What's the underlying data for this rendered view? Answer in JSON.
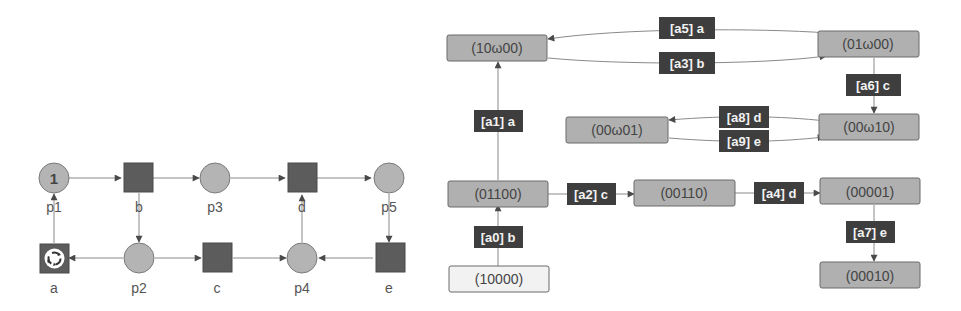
{
  "petri_net": {
    "places": [
      {
        "id": "p1",
        "label": "p1",
        "tokens": "1"
      },
      {
        "id": "p2",
        "label": "p2",
        "tokens": ""
      },
      {
        "id": "p3",
        "label": "p3",
        "tokens": ""
      },
      {
        "id": "p4",
        "label": "p4",
        "tokens": ""
      },
      {
        "id": "p5",
        "label": "p5",
        "tokens": ""
      }
    ],
    "transitions": [
      {
        "id": "a",
        "label": "a",
        "icon": "refresh-cycle-icon"
      },
      {
        "id": "b",
        "label": "b"
      },
      {
        "id": "c",
        "label": "c"
      },
      {
        "id": "d",
        "label": "d"
      },
      {
        "id": "e",
        "label": "e"
      }
    ],
    "arcs": [
      {
        "from": "p1",
        "to": "b"
      },
      {
        "from": "b",
        "to": "p3"
      },
      {
        "from": "p3",
        "to": "d"
      },
      {
        "from": "d",
        "to": "p5"
      },
      {
        "from": "b",
        "to": "p2"
      },
      {
        "from": "p2",
        "to": "a"
      },
      {
        "from": "a",
        "to": "p1"
      },
      {
        "from": "p2",
        "to": "c"
      },
      {
        "from": "c",
        "to": "p4"
      },
      {
        "from": "p4",
        "to": "d"
      },
      {
        "from": "p5",
        "to": "e"
      },
      {
        "from": "e",
        "to": "p4"
      }
    ]
  },
  "coverability_graph": {
    "states": [
      {
        "id": "s10000",
        "label": "(10000)",
        "initial": true
      },
      {
        "id": "s01100",
        "label": "(01100)"
      },
      {
        "id": "s10w00",
        "label": "(10ω00)"
      },
      {
        "id": "s01w00",
        "label": "(01ω00)"
      },
      {
        "id": "s00w10",
        "label": "(00ω10)"
      },
      {
        "id": "s00w01",
        "label": "(00ω01)"
      },
      {
        "id": "s00110",
        "label": "(00110)"
      },
      {
        "id": "s00001",
        "label": "(00001)"
      },
      {
        "id": "s00010",
        "label": "(00010)"
      }
    ],
    "edges": [
      {
        "id": "a0",
        "label": "[a0] b",
        "from": "(10000)",
        "to": "(01100)"
      },
      {
        "id": "a1",
        "label": "[a1] a",
        "from": "(01100)",
        "to": "(10ω00)"
      },
      {
        "id": "a2",
        "label": "[a2] c",
        "from": "(01100)",
        "to": "(00110)"
      },
      {
        "id": "a3",
        "label": "[a3] b",
        "from": "(10ω00)",
        "to": "(01ω00)"
      },
      {
        "id": "a4",
        "label": "[a4] d",
        "from": "(00110)",
        "to": "(00001)"
      },
      {
        "id": "a5",
        "label": "[a5] a",
        "from": "(01ω00)",
        "to": "(10ω00)"
      },
      {
        "id": "a6",
        "label": "[a6] c",
        "from": "(01ω00)",
        "to": "(00ω10)"
      },
      {
        "id": "a7",
        "label": "[a7] e",
        "from": "(00001)",
        "to": "(00010)"
      },
      {
        "id": "a8",
        "label": "[a8] d",
        "from": "(00ω10)",
        "to": "(00ω01)"
      },
      {
        "id": "a9",
        "label": "[a9] e",
        "from": "(00ω01)",
        "to": "(00ω10)"
      }
    ]
  },
  "colors": {
    "place_fill": "#b4b4b4",
    "transition_fill": "#5c5c5c",
    "state_fill": "#b0b0b0",
    "initial_state_fill": "#f2f2f2",
    "edge_label_bg": "#3e3e3e"
  }
}
